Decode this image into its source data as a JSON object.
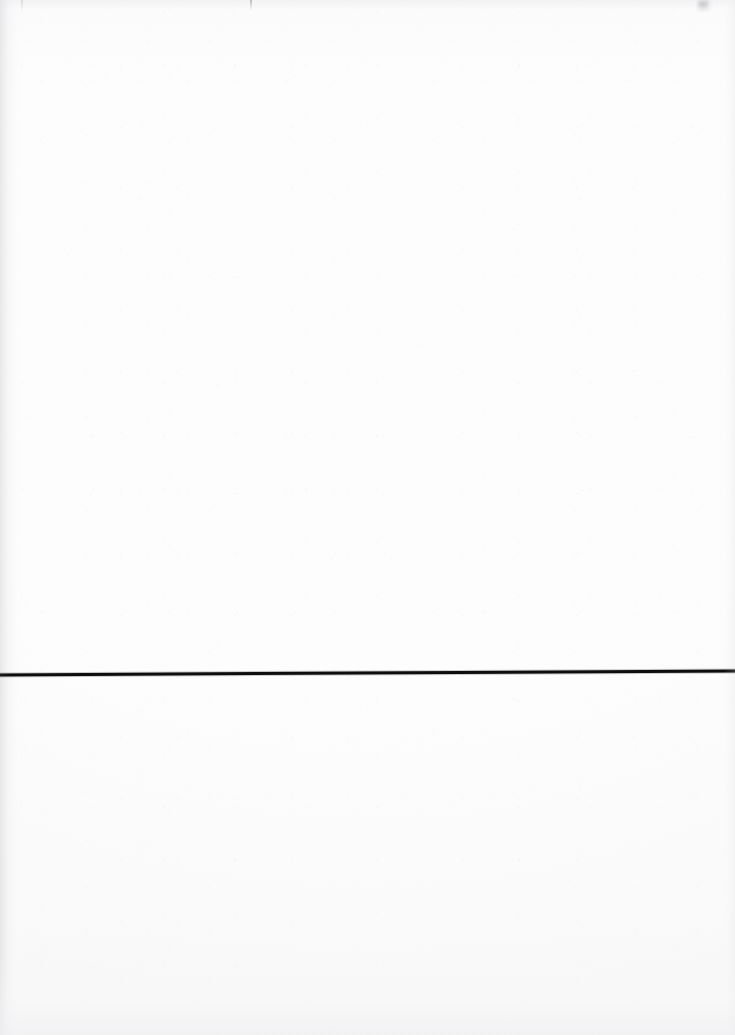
{
  "document": {
    "kind": "scanned-blank-page",
    "caption": "",
    "page_width": 735,
    "page_height": 1035,
    "background_color": "#fdfdfd",
    "body_text": "",
    "header_text": "",
    "footer_text": ""
  },
  "rule": {
    "name": "horizontal-rule",
    "color": "#0d0d0d",
    "thickness": 3,
    "x_start": 0,
    "x_end": 735,
    "y_start": 675,
    "y_end": 671
  },
  "artifacts": {
    "items": [
      {
        "name": "tick-mark-left",
        "x": 21,
        "y": 0,
        "width": 2,
        "height": 13,
        "color": "#c6c6c9"
      },
      {
        "name": "tick-mark-center",
        "x": 250,
        "y": 0,
        "width": 2,
        "height": 11,
        "color": "#acacb0"
      },
      {
        "name": "smudge-right",
        "x": 697,
        "y": 0,
        "width": 15,
        "height": 12,
        "color": "#a6a6ab"
      }
    ]
  }
}
